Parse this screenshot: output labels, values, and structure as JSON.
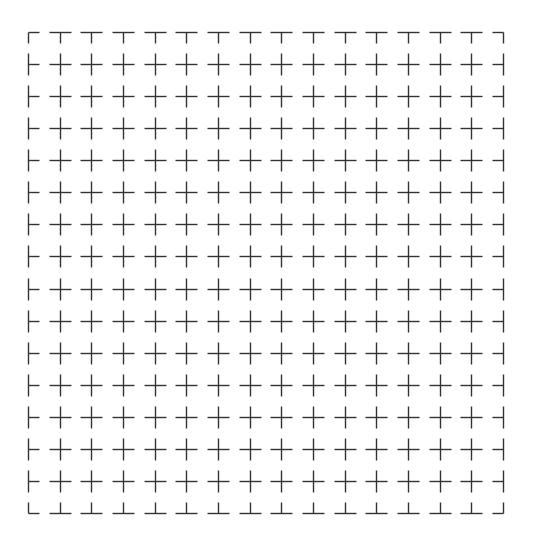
{
  "pattern": {
    "type": "crosshair-grid",
    "columns": 16,
    "rows": 16,
    "origin_x": 28,
    "origin_y": 32,
    "end_x": 503,
    "end_y": 513,
    "arm_length": 11,
    "stroke_color": "#333333",
    "stroke_width": 1.4,
    "background": "#ffffff"
  }
}
